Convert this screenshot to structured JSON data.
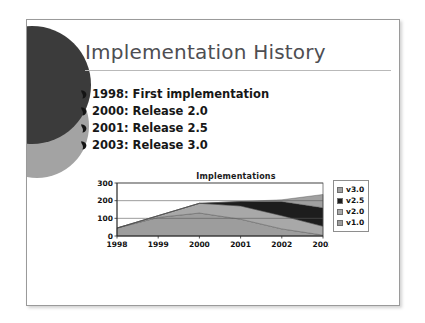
{
  "slide": {
    "title": "Implementation History",
    "bullets": [
      {
        "marker": "teardrop-bullet-icon",
        "text": "1998: First implementation"
      },
      {
        "marker": "teardrop-bullet-icon",
        "text": "2000: Release 2.0"
      },
      {
        "marker": "teardrop-bullet-icon",
        "text": "2001: Release 2.5"
      },
      {
        "marker": "teardrop-bullet-icon",
        "text": "2003: Release 3.0"
      }
    ],
    "decorations": [
      {
        "name": "deco-circle-dark",
        "color": "#3b3b3b"
      },
      {
        "name": "deco-circle-gray",
        "color": "#a3a3a3"
      }
    ],
    "colors": {
      "title_text": "#4e4e52",
      "body_text": "#171717",
      "rule": "#b9b9b9",
      "border": "#9a9a9a",
      "background": "#ffffff"
    }
  },
  "chart_data": {
    "type": "area",
    "stacked": true,
    "title": "Implementations",
    "xlabel": "",
    "ylabel": "",
    "categories": [
      "1998",
      "1999",
      "2000",
      "2001",
      "2002",
      "2003"
    ],
    "x": [
      1998,
      1999,
      2000,
      2001,
      2002,
      2003
    ],
    "ylim": [
      0,
      300
    ],
    "yticks": [
      0,
      100,
      200,
      300
    ],
    "ytick_labels": [
      "0",
      "100",
      "200",
      "300"
    ],
    "grid": true,
    "legend_position": "right",
    "series": [
      {
        "name": "v1.0",
        "color": "#9d9d9d",
        "values": [
          45,
          105,
          130,
          95,
          40,
          5
        ]
      },
      {
        "name": "v2.0",
        "color": "#a8a8a8",
        "values": [
          0,
          10,
          55,
          75,
          75,
          50
        ]
      },
      {
        "name": "v2.5",
        "color": "#1d1d1d",
        "values": [
          0,
          0,
          0,
          25,
          80,
          105
        ]
      },
      {
        "name": "v3.0",
        "color": "#a0a0a0",
        "values": [
          0,
          0,
          0,
          0,
          10,
          75
        ]
      }
    ],
    "legend": [
      {
        "label": "v3.0",
        "color": "#a0a0a0"
      },
      {
        "label": "v2.5",
        "color": "#1d1d1d"
      },
      {
        "label": "v2.0",
        "color": "#a8a8a8"
      },
      {
        "label": "v1.0",
        "color": "#9d9d9d"
      }
    ],
    "totals": [
      45,
      115,
      185,
      195,
      205,
      235
    ]
  }
}
